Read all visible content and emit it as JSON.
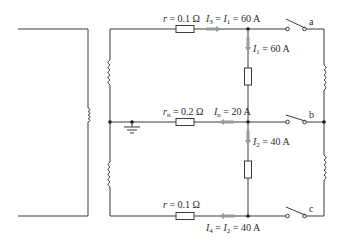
{
  "diagram": {
    "type": "three-wire transformer secondary circuit with loads",
    "labels": {
      "top_resistor": "r = 0.1 Ω",
      "top_current": "I3 = I1 = 60 A",
      "top_load_current": "I1 = 60 A",
      "neutral_resistor": "rn = 0.2 Ω",
      "neutral_current": "In = 20 A",
      "bottom_load_current": "I2 = 40 A",
      "bottom_resistor": "r = 0.1 Ω",
      "bottom_current": "I4 = I2 = 40 A"
    },
    "switches": [
      {
        "label": "a"
      },
      {
        "label": "b"
      },
      {
        "label": "c"
      }
    ],
    "parts": {
      "top_r": {
        "sym": "r",
        "eq": " = 0.1 Ω"
      },
      "top_i": {
        "sym1": "I",
        "sub1": "3",
        "mid": " = ",
        "sym2": "I",
        "sub2": "1",
        "val": " = 60 A"
      },
      "load1_i": {
        "sym": "I",
        "sub": "1",
        "val": " = 60 A"
      },
      "n_r": {
        "sym": "r",
        "sub": "n",
        "eq": " = 0.2 Ω"
      },
      "n_i": {
        "sym": "I",
        "sub": "n",
        "val": " = 20 A"
      },
      "load2_i": {
        "sym": "I",
        "sub": "2",
        "val": " = 40 A"
      },
      "bot_r": {
        "sym": "r",
        "eq": " = 0.1 Ω"
      },
      "bot_i": {
        "sym1": "I",
        "sub1": "4",
        "mid": " = ",
        "sym2": "I",
        "sub2": "2",
        "val": " = 40 A"
      }
    },
    "colors": {
      "wire": "#3a3a3a",
      "arrow": "#9a9a9a",
      "text": "#2a2a2a"
    }
  }
}
